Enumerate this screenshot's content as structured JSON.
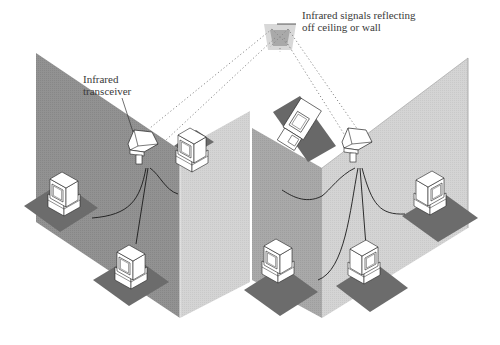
{
  "diagram": {
    "labels": {
      "signals_line1": "Infrared signals reflecting",
      "signals_line2": "off ceiling or wall",
      "transceiver_line1": "Infrared",
      "transceiver_line2": "transceiver"
    },
    "colors": {
      "wall_dark": "#8f8f8f",
      "wall_mid": "#a6a6a6",
      "wall_light": "#d2d2d2",
      "floor_pad": "#6c6c6c",
      "computer_fill": "#ffffff",
      "outline": "#222222",
      "signal_dots": "#8a8a8a",
      "reflector_outer": "#d8d8d8",
      "reflector_inner": "#a9a9a9"
    },
    "nodes": [
      {
        "id": "transceiver-left",
        "type": "infrared-transceiver"
      },
      {
        "id": "transceiver-right",
        "type": "infrared-transceiver"
      },
      {
        "id": "ceiling-reflection",
        "type": "reflection-point"
      },
      {
        "id": "pc-left-1",
        "type": "computer"
      },
      {
        "id": "pc-left-2",
        "type": "computer"
      },
      {
        "id": "pc-left-3",
        "type": "computer"
      },
      {
        "id": "pc-right-1",
        "type": "computer"
      },
      {
        "id": "pc-right-2",
        "type": "computer"
      },
      {
        "id": "pc-right-3",
        "type": "computer"
      },
      {
        "id": "pc-right-4",
        "type": "computer"
      }
    ]
  }
}
